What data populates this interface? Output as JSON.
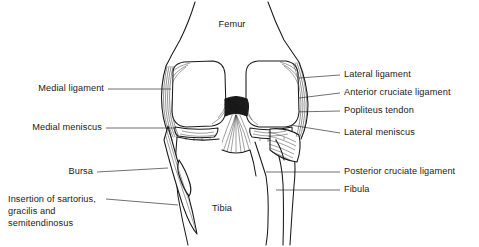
{
  "figure": {
    "kind": "anatomical-line-drawing",
    "colors": {
      "background": "#ffffff",
      "ink": "#1a1a1a",
      "leader_line": "#555555",
      "shading": "#2b2b2b"
    }
  },
  "labels": {
    "femur": "Femur",
    "tibia": "Tibia",
    "medial_ligament": "Medial ligament",
    "medial_meniscus": "Medial meniscus",
    "bursa": "Bursa",
    "insertion_line1": "Insertion of sartorius,",
    "insertion_line2": "gracilis and",
    "insertion_line3": "semitendinosus",
    "lateral_ligament": "Lateral ligament",
    "anterior_cruciate_ligament": "Anterior cruciate ligament",
    "popliteus_tendon": "Popliteus tendon",
    "lateral_meniscus": "Lateral meniscus",
    "posterior_cruciate_ligament": "Posterior cruciate ligament",
    "fibula": "Fibula"
  }
}
